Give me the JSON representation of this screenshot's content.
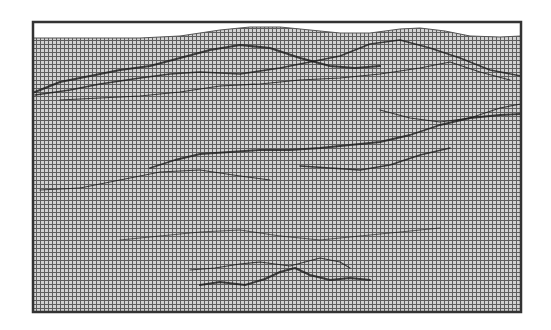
{
  "figure": {
    "frame": {
      "x": 33,
      "y": 22,
      "width": 488,
      "height": 290,
      "stroke": "#333333",
      "stroke_width": 2.5
    },
    "grid": {
      "spacing": 4,
      "line_color": "#555555",
      "background": "#c9c9c9"
    },
    "top_profile": [
      [
        33,
        38
      ],
      [
        80,
        38
      ],
      [
        140,
        38
      ],
      [
        180,
        36
      ],
      [
        220,
        30
      ],
      [
        250,
        27
      ],
      [
        280,
        27
      ],
      [
        310,
        30
      ],
      [
        340,
        33
      ],
      [
        370,
        33
      ],
      [
        400,
        29
      ],
      [
        420,
        28
      ],
      [
        445,
        31
      ],
      [
        470,
        36
      ],
      [
        500,
        37
      ],
      [
        521,
        36
      ]
    ],
    "ridges": [
      {
        "points": [
          [
            35,
            92
          ],
          [
            60,
            82
          ],
          [
            90,
            76
          ],
          [
            120,
            70
          ],
          [
            150,
            66
          ],
          [
            180,
            58
          ],
          [
            210,
            50
          ],
          [
            240,
            45
          ],
          [
            270,
            48
          ],
          [
            300,
            58
          ],
          [
            330,
            66
          ],
          [
            355,
            68
          ],
          [
            380,
            66
          ]
        ],
        "width": 2.2
      },
      {
        "points": [
          [
            35,
            95
          ],
          [
            70,
            90
          ],
          [
            100,
            84
          ],
          [
            140,
            78
          ],
          [
            170,
            74
          ],
          [
            200,
            72
          ],
          [
            240,
            74
          ],
          [
            280,
            68
          ],
          [
            310,
            62
          ],
          [
            340,
            56
          ],
          [
            370,
            44
          ],
          [
            400,
            40
          ],
          [
            430,
            48
          ],
          [
            460,
            58
          ],
          [
            490,
            70
          ],
          [
            521,
            76
          ]
        ],
        "width": 1.6
      },
      {
        "points": [
          [
            60,
            100
          ],
          [
            100,
            98
          ],
          [
            140,
            96
          ],
          [
            180,
            92
          ],
          [
            220,
            86
          ],
          [
            260,
            84
          ],
          [
            300,
            80
          ],
          [
            340,
            78
          ],
          [
            380,
            74
          ],
          [
            420,
            68
          ],
          [
            450,
            62
          ],
          [
            480,
            72
          ],
          [
            510,
            80
          ]
        ],
        "width": 1.2
      },
      {
        "points": [
          [
            150,
            168
          ],
          [
            175,
            160
          ],
          [
            200,
            154
          ],
          [
            230,
            152
          ],
          [
            260,
            150
          ],
          [
            290,
            150
          ],
          [
            320,
            148
          ],
          [
            350,
            145
          ],
          [
            380,
            142
          ],
          [
            410,
            135
          ],
          [
            440,
            125
          ],
          [
            470,
            118
          ],
          [
            500,
            115
          ],
          [
            521,
            114
          ]
        ],
        "width": 1.8
      },
      {
        "points": [
          [
            300,
            166
          ],
          [
            330,
            168
          ],
          [
            360,
            170
          ],
          [
            390,
            165
          ],
          [
            420,
            155
          ],
          [
            450,
            148
          ]
        ],
        "width": 1.4
      },
      {
        "points": [
          [
            40,
            190
          ],
          [
            80,
            188
          ],
          [
            120,
            180
          ],
          [
            160,
            172
          ],
          [
            200,
            170
          ],
          [
            240,
            176
          ],
          [
            270,
            180
          ]
        ],
        "width": 1.0
      },
      {
        "points": [
          [
            380,
            110
          ],
          [
            410,
            118
          ],
          [
            440,
            122
          ],
          [
            470,
            118
          ],
          [
            500,
            108
          ],
          [
            521,
            104
          ]
        ],
        "width": 1.2
      },
      {
        "points": [
          [
            200,
            285
          ],
          [
            220,
            282
          ],
          [
            245,
            285
          ],
          [
            265,
            279
          ],
          [
            280,
            272
          ],
          [
            295,
            268
          ],
          [
            310,
            275
          ],
          [
            330,
            280
          ],
          [
            350,
            278
          ],
          [
            370,
            280
          ]
        ],
        "width": 2.0
      },
      {
        "points": [
          [
            190,
            270
          ],
          [
            215,
            268
          ],
          [
            240,
            264
          ],
          [
            260,
            262
          ],
          [
            290,
            266
          ],
          [
            305,
            262
          ],
          [
            320,
            258
          ],
          [
            340,
            262
          ],
          [
            350,
            268
          ]
        ],
        "width": 1.2
      },
      {
        "points": [
          [
            120,
            240
          ],
          [
            160,
            236
          ],
          [
            200,
            232
          ],
          [
            240,
            230
          ],
          [
            280,
            236
          ],
          [
            320,
            240
          ],
          [
            360,
            236
          ],
          [
            400,
            232
          ],
          [
            440,
            228
          ]
        ],
        "width": 0.8
      }
    ]
  }
}
